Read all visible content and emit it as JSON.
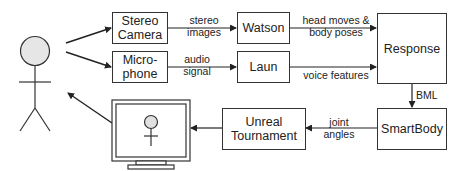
{
  "diagram": {
    "nodes": {
      "stereo_camera": "Stereo\nCamera",
      "microphone": "Micro-\nphone",
      "watson": "Watson",
      "laun": "Laun",
      "response": "Response",
      "smartbody": "SmartBody",
      "unreal": "Unreal\nTournament"
    },
    "edges": {
      "stereo_images": "stereo\nimages",
      "audio_signal": "audio\nsignal",
      "head_body": "head moves &\nbody poses",
      "voice_features": "voice features",
      "bml": "BML",
      "joint_angles": "joint\nangles"
    },
    "actors": [
      "user",
      "virtual-human-on-monitor"
    ]
  }
}
